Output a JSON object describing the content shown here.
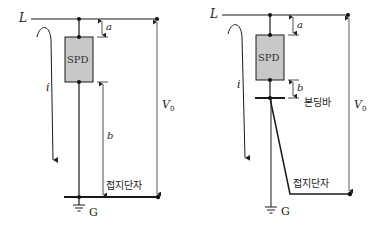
{
  "diagrams": [
    {
      "line_label": "L",
      "device_label": "SPD",
      "current_label": "i",
      "dim_a_label": "a",
      "dim_b_label": "b",
      "voltage_label": "V",
      "voltage_sub": "0",
      "terminal_label": "접지단자",
      "ground_label": "G"
    },
    {
      "line_label": "L",
      "device_label": "SPD",
      "current_label": "i",
      "dim_a_label": "a",
      "dim_b_label": "b",
      "voltage_label": "V",
      "voltage_sub": "0",
      "bonding_bar_label": "본딩바",
      "terminal_label": "접지단자",
      "ground_label": "G"
    }
  ],
  "colors": {
    "line": "#1a1a1a",
    "spd_fill": "#c8c8c8",
    "thin": "#444444"
  }
}
